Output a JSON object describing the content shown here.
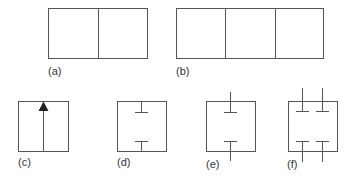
{
  "figure": {
    "stroke_color": "#555555",
    "panels": [
      {
        "id": "a",
        "label": "(a)",
        "description": "rectangle split into 2 cells"
      },
      {
        "id": "b",
        "label": "(b)",
        "description": "rectangle split into 3 cells"
      },
      {
        "id": "c",
        "label": "(c)",
        "description": "square with central vertical line and upward arrow"
      },
      {
        "id": "d",
        "label": "(d)",
        "description": "square with internal top and bottom T-stubs"
      },
      {
        "id": "e",
        "label": "(e)",
        "description": "square with T-stubs extending outside at top and bottom"
      },
      {
        "id": "f",
        "label": "(f)",
        "description": "square with two T-stubs at top and two at bottom, extending outside"
      }
    ]
  }
}
